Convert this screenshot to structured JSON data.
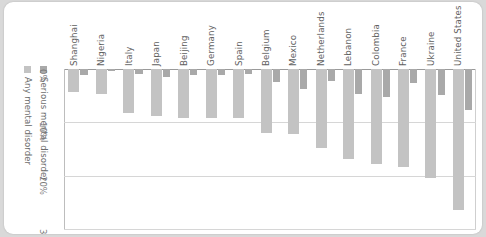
{
  "chart_data": {
    "type": "bar",
    "title": "",
    "subtitle": "",
    "xlabel": "",
    "ylabel": "",
    "orientation": "vertical-descending",
    "grid": true,
    "legend_position": "left",
    "ylim": [
      0,
      30
    ],
    "yticks": [
      "0%",
      "10%",
      "20%",
      "30%"
    ],
    "ytick_values": [
      0,
      10,
      20,
      30
    ],
    "categories": [
      "Shanghai",
      "Nigeria",
      "Italy",
      "Japan",
      "Beijing",
      "Germany",
      "Spain",
      "Belgium",
      "Mexico",
      "Netherlands",
      "Lebanon",
      "Colombia",
      "France",
      "Ukraine",
      "United States"
    ],
    "series": [
      {
        "name": "Any mental disorder",
        "color": "#c3c3c3",
        "values": [
          4.3,
          4.7,
          8.2,
          8.8,
          9.1,
          9.1,
          9.2,
          12.0,
          12.2,
          14.9,
          16.9,
          17.8,
          18.4,
          20.5,
          26.4
        ]
      },
      {
        "name": "Serious mental disorder",
        "color": "#a9a9a9",
        "values": [
          1.1,
          0.4,
          1.0,
          1.5,
          1.2,
          1.2,
          1.0,
          2.4,
          3.7,
          2.3,
          4.6,
          5.2,
          2.7,
          4.8,
          7.7
        ]
      }
    ]
  },
  "legend": {
    "items": [
      {
        "label": "Any mental disorder",
        "color": "#c3c3c3"
      },
      {
        "label": "Serious mental disorder",
        "color": "#a9a9a9"
      }
    ]
  }
}
